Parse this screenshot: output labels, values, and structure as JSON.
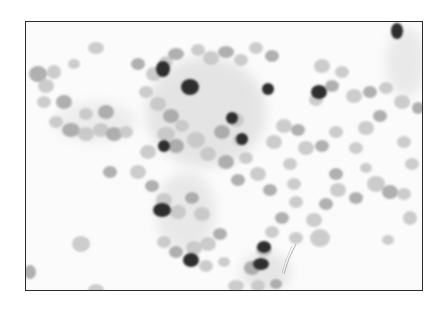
{
  "image": {
    "description": "Grayscale cytology micrograph showing clusters of cells with scattered darkly stained nuclei",
    "colors": {
      "background": "#fbfbfb",
      "border": "#2a2a2a",
      "cell_light": "#c4c4c4",
      "cell_mid": "#a2a2a2",
      "nucleus_dark": "#2e2e2e"
    },
    "light_cells": [
      [
        12,
        52,
        9,
        8
      ],
      [
        28,
        50,
        7,
        7
      ],
      [
        20,
        64,
        8,
        7
      ],
      [
        38,
        80,
        8,
        7
      ],
      [
        18,
        80,
        7,
        6
      ],
      [
        30,
        100,
        7,
        6
      ],
      [
        45,
        108,
        9,
        7
      ],
      [
        60,
        112,
        8,
        7
      ],
      [
        75,
        108,
        8,
        7
      ],
      [
        88,
        112,
        8,
        7
      ],
      [
        100,
        110,
        7,
        6
      ],
      [
        60,
        92,
        7,
        6
      ],
      [
        80,
        90,
        8,
        7
      ],
      [
        48,
        42,
        6,
        5
      ],
      [
        70,
        26,
        8,
        6
      ],
      [
        112,
        42,
        7,
        6
      ],
      [
        128,
        52,
        8,
        7
      ],
      [
        140,
        40,
        7,
        6
      ],
      [
        150,
        32,
        8,
        6
      ],
      [
        172,
        28,
        7,
        6
      ],
      [
        185,
        36,
        8,
        7
      ],
      [
        200,
        30,
        8,
        6
      ],
      [
        215,
        38,
        7,
        6
      ],
      [
        230,
        26,
        7,
        6
      ],
      [
        246,
        34,
        7,
        6
      ],
      [
        120,
        70,
        7,
        6
      ],
      [
        132,
        82,
        8,
        7
      ],
      [
        145,
        94,
        8,
        7
      ],
      [
        156,
        104,
        7,
        6
      ],
      [
        140,
        112,
        9,
        7
      ],
      [
        150,
        124,
        8,
        7
      ],
      [
        170,
        118,
        9,
        8
      ],
      [
        182,
        132,
        8,
        7
      ],
      [
        196,
        110,
        8,
        7
      ],
      [
        210,
        98,
        8,
        7
      ],
      [
        214,
        118,
        7,
        6
      ],
      [
        200,
        140,
        8,
        7
      ],
      [
        220,
        136,
        7,
        6
      ],
      [
        232,
        152,
        8,
        7
      ],
      [
        212,
        158,
        7,
        6
      ],
      [
        248,
        120,
        8,
        7
      ],
      [
        258,
        104,
        8,
        7
      ],
      [
        272,
        108,
        7,
        6
      ],
      [
        280,
        126,
        8,
        7
      ],
      [
        264,
        142,
        7,
        6
      ],
      [
        244,
        168,
        7,
        6
      ],
      [
        122,
        130,
        8,
        7
      ],
      [
        112,
        150,
        8,
        7
      ],
      [
        126,
        164,
        7,
        6
      ],
      [
        138,
        178,
        8,
        7
      ],
      [
        152,
        190,
        8,
        7
      ],
      [
        166,
        176,
        7,
        6
      ],
      [
        176,
        192,
        8,
        7
      ],
      [
        168,
        226,
        8,
        7
      ],
      [
        150,
        230,
        7,
        6
      ],
      [
        138,
        220,
        7,
        6
      ],
      [
        182,
        222,
        8,
        7
      ],
      [
        194,
        212,
        7,
        6
      ],
      [
        180,
        244,
        7,
        6
      ],
      [
        198,
        240,
        6,
        5
      ],
      [
        84,
        150,
        7,
        6
      ],
      [
        55,
        222,
        9,
        8
      ],
      [
        70,
        268,
        8,
        6
      ],
      [
        4,
        250,
        6,
        7
      ],
      [
        296,
        44,
        8,
        7
      ],
      [
        316,
        50,
        7,
        6
      ],
      [
        306,
        64,
        7,
        6
      ],
      [
        290,
        78,
        7,
        6
      ],
      [
        328,
        74,
        8,
        7
      ],
      [
        344,
        70,
        7,
        6
      ],
      [
        360,
        66,
        7,
        6
      ],
      [
        376,
        80,
        8,
        7
      ],
      [
        354,
        94,
        7,
        6
      ],
      [
        340,
        106,
        8,
        7
      ],
      [
        310,
        110,
        7,
        6
      ],
      [
        296,
        124,
        7,
        6
      ],
      [
        330,
        126,
        7,
        6
      ],
      [
        378,
        120,
        7,
        6
      ],
      [
        392,
        86,
        6,
        6
      ],
      [
        386,
        142,
        7,
        6
      ],
      [
        350,
        162,
        9,
        8
      ],
      [
        364,
        170,
        8,
        7
      ],
      [
        378,
        172,
        7,
        6
      ],
      [
        312,
        168,
        8,
        7
      ],
      [
        300,
        182,
        7,
        6
      ],
      [
        288,
        198,
        8,
        7
      ],
      [
        270,
        180,
        7,
        6
      ],
      [
        256,
        196,
        7,
        6
      ],
      [
        246,
        210,
        7,
        6
      ],
      [
        238,
        228,
        8,
        7
      ],
      [
        226,
        246,
        8,
        7
      ],
      [
        232,
        264,
        7,
        6
      ],
      [
        294,
        216,
        10,
        9
      ],
      [
        330,
        176,
        7,
        6
      ],
      [
        384,
        196,
        7,
        7
      ],
      [
        362,
        218,
        6,
        5
      ],
      [
        250,
        262,
        6,
        5
      ],
      [
        210,
        264,
        8,
        6
      ],
      [
        270,
        216,
        7,
        6
      ],
      [
        310,
        152,
        7,
        6
      ],
      [
        340,
        146,
        6,
        5
      ],
      [
        268,
        162,
        7,
        6
      ]
    ],
    "dark_nuclei": [
      [
        137,
        47,
        7,
        8
      ],
      [
        164,
        65,
        9,
        8
      ],
      [
        242,
        67,
        6,
        6
      ],
      [
        293,
        70,
        8,
        7
      ],
      [
        206,
        96,
        6,
        6
      ],
      [
        216,
        117,
        6,
        6
      ],
      [
        136,
        188,
        9,
        7
      ],
      [
        165,
        238,
        8,
        7
      ],
      [
        371,
        9,
        6,
        8
      ],
      [
        238,
        225,
        7,
        6
      ],
      [
        235,
        242,
        8,
        6
      ],
      [
        138,
        124,
        6,
        6
      ]
    ],
    "annotations": {
      "fiber": "thin curved fiber near lower center"
    }
  }
}
